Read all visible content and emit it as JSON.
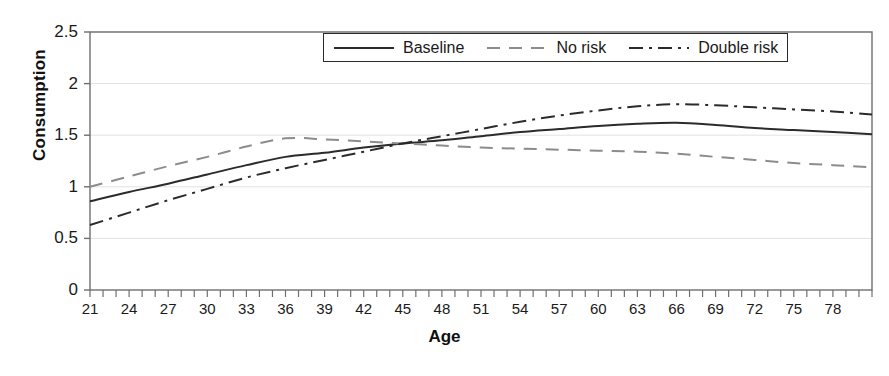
{
  "chart_data": {
    "type": "line",
    "title": "",
    "xlabel": "Age",
    "ylabel": "Consumption",
    "xlim": [
      21,
      81
    ],
    "ylim": [
      0,
      2.5
    ],
    "grid": true,
    "grid_axis": "y",
    "legend_position": "top-center",
    "y_ticks": [
      "0",
      "0.5",
      "1",
      "1.5",
      "2",
      "2.5"
    ],
    "y_tick_values": [
      0,
      0.5,
      1,
      1.5,
      2,
      2.5
    ],
    "x_ticks": [
      "21",
      "24",
      "27",
      "30",
      "33",
      "36",
      "39",
      "42",
      "45",
      "48",
      "51",
      "54",
      "57",
      "60",
      "63",
      "66",
      "69",
      "72",
      "75",
      "78"
    ],
    "x_tick_values": [
      21,
      24,
      27,
      30,
      33,
      36,
      39,
      42,
      45,
      48,
      51,
      54,
      57,
      60,
      63,
      66,
      69,
      72,
      75,
      78
    ],
    "x_minor_tick_step": 1,
    "x": [
      21,
      24,
      27,
      30,
      33,
      36,
      39,
      42,
      45,
      48,
      51,
      54,
      57,
      60,
      63,
      66,
      69,
      72,
      75,
      78,
      81
    ],
    "series": [
      {
        "name": "Baseline",
        "style": "solid",
        "color": "#2b2b2b",
        "values": [
          0.86,
          0.95,
          1.03,
          1.12,
          1.21,
          1.29,
          1.33,
          1.38,
          1.42,
          1.45,
          1.49,
          1.53,
          1.56,
          1.59,
          1.61,
          1.62,
          1.6,
          1.57,
          1.55,
          1.53,
          1.51
        ]
      },
      {
        "name": "No risk",
        "style": "dashed",
        "color": "#8c8c8c",
        "values": [
          1.0,
          1.1,
          1.2,
          1.29,
          1.39,
          1.47,
          1.46,
          1.44,
          1.42,
          1.4,
          1.38,
          1.37,
          1.36,
          1.35,
          1.34,
          1.32,
          1.29,
          1.26,
          1.23,
          1.21,
          1.19
        ]
      },
      {
        "name": "Double risk",
        "style": "dash-dot",
        "color": "#2b2b2b",
        "values": [
          0.63,
          0.75,
          0.87,
          0.98,
          1.09,
          1.18,
          1.26,
          1.34,
          1.42,
          1.49,
          1.56,
          1.63,
          1.69,
          1.74,
          1.78,
          1.8,
          1.79,
          1.77,
          1.75,
          1.73,
          1.7
        ]
      }
    ]
  },
  "legend": {
    "entries": [
      {
        "label": "Baseline"
      },
      {
        "label": "No risk"
      },
      {
        "label": "Double risk"
      }
    ]
  },
  "axes": {
    "y_title": "Consumption",
    "x_title": "Age"
  },
  "caption": {
    "text": ""
  }
}
